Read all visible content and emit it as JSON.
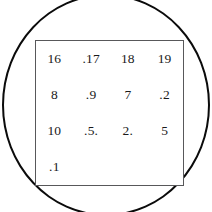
{
  "figure": {
    "background_color": "#ffffff",
    "shapes": {
      "circle": {
        "name": "circle-outline",
        "stroke_color": "#0b0b0b",
        "fill": "none"
      },
      "rectangle": {
        "name": "rectangle-outline",
        "stroke_color": "#58585a",
        "fill": "#ffffff"
      }
    },
    "text_color": "#1a1a1a"
  },
  "chart_data": {
    "type": "table",
    "title": "",
    "rows": [
      [
        "16",
        ".17",
        "18",
        "19"
      ],
      [
        "8",
        ".9",
        "7",
        ".2"
      ],
      [
        "10",
        ".5.",
        "2.",
        "5"
      ],
      [
        ".1",
        "",
        "",
        ""
      ]
    ]
  }
}
